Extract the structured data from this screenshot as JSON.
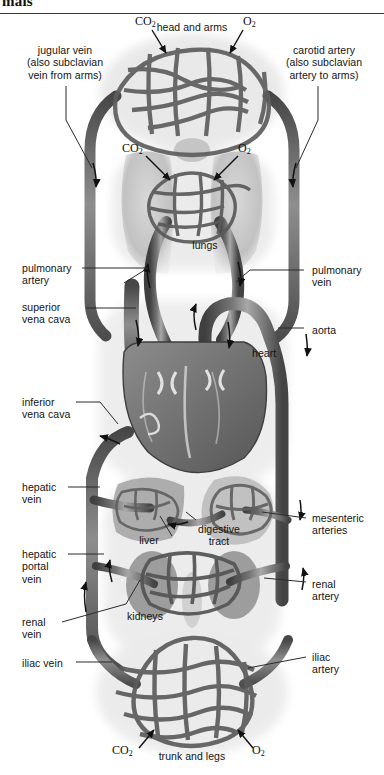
{
  "page": {
    "header_partial_word": "mals",
    "width": 384,
    "height": 775,
    "style": "grayscale anatomical illustration"
  },
  "figure": {
    "ink_color": "#3b3b3b",
    "vessel_dark": "#4a4a4a",
    "vessel_mid": "#6d6d6d",
    "vessel_light": "#9a9a9a",
    "organ_wash": "#bdbdbd",
    "background": "#ffffff"
  },
  "labels": {
    "left": [
      {
        "id": "jugular-vein",
        "text": "jugular vein\n(also subclavian\nvein from arms)",
        "x": 27,
        "y": 44,
        "align": "center"
      },
      {
        "id": "pulmonary-artery",
        "text": "pulmonary\nartery",
        "x": 22,
        "y": 262,
        "align": "left"
      },
      {
        "id": "superior-vena-cava",
        "text": "superior\nvena cava",
        "x": 22,
        "y": 301,
        "align": "left"
      },
      {
        "id": "inferior-vena-cava",
        "text": "inferior\nvena cava",
        "x": 22,
        "y": 396,
        "align": "left"
      },
      {
        "id": "hepatic-vein",
        "text": "hepatic\nvein",
        "x": 22,
        "y": 481,
        "align": "left"
      },
      {
        "id": "hepatic-portal-vein",
        "text": "hepatic\nportal\nvein",
        "x": 22,
        "y": 548,
        "align": "left"
      },
      {
        "id": "renal-vein",
        "text": "renal\nvein",
        "x": 22,
        "y": 616,
        "align": "left"
      },
      {
        "id": "iliac-vein",
        "text": "iliac vein",
        "x": 22,
        "y": 657,
        "align": "left"
      }
    ],
    "right": [
      {
        "id": "carotid-artery",
        "text": "carotid artery\n(also subclavian\nartery to arms)",
        "x": 287,
        "y": 44,
        "align": "center"
      },
      {
        "id": "pulmonary-vein",
        "text": "pulmonary\nvein",
        "x": 312,
        "y": 264,
        "align": "left"
      },
      {
        "id": "aorta",
        "text": "aorta",
        "x": 312,
        "y": 324,
        "align": "left"
      },
      {
        "id": "mesenteric-arteries",
        "text": "mesenteric\narteries",
        "x": 312,
        "y": 512,
        "align": "left"
      },
      {
        "id": "renal-artery",
        "text": "renal\nartery",
        "x": 312,
        "y": 578,
        "align": "left"
      },
      {
        "id": "iliac-artery",
        "text": "iliac\nartery",
        "x": 312,
        "y": 651,
        "align": "left"
      }
    ],
    "inner": [
      {
        "id": "head-and-arms",
        "text": "head and arms",
        "x": 192,
        "y": 26,
        "align": "center"
      },
      {
        "id": "lungs",
        "text": "lungs",
        "x": 205,
        "y": 243,
        "align": "center"
      },
      {
        "id": "heart",
        "text": "heart",
        "x": 258,
        "y": 350,
        "align": "left"
      },
      {
        "id": "liver",
        "text": "liver",
        "x": 148,
        "y": 538,
        "align": "center"
      },
      {
        "id": "digestive-tract",
        "text": "digestive\ntract",
        "x": 218,
        "y": 527,
        "align": "center"
      },
      {
        "id": "kidneys",
        "text": "kidneys",
        "x": 129,
        "y": 613,
        "align": "left"
      },
      {
        "id": "trunk-and-legs",
        "text": "trunk and legs",
        "x": 192,
        "y": 753,
        "align": "center"
      }
    ]
  },
  "gas_markers": [
    {
      "id": "co2-head",
      "formula": "CO",
      "subscript": "2",
      "x": 141,
      "y": 19,
      "site": "head and arms capillaries"
    },
    {
      "id": "o2-head",
      "formula": "O",
      "subscript": "2",
      "x": 244,
      "y": 19,
      "site": "head and arms capillaries"
    },
    {
      "id": "co2-lungs",
      "formula": "CO",
      "subscript": "2",
      "x": 128,
      "y": 146,
      "site": "lung capillaries"
    },
    {
      "id": "o2-lungs",
      "formula": "O",
      "subscript": "2",
      "x": 238,
      "y": 146,
      "site": "lung capillaries"
    },
    {
      "id": "co2-trunk",
      "formula": "CO",
      "subscript": "2",
      "x": 119,
      "y": 748,
      "site": "trunk and legs capillaries"
    },
    {
      "id": "o2-trunk",
      "formula": "O",
      "subscript": "2",
      "x": 252,
      "y": 748,
      "site": "trunk and legs capillaries"
    }
  ],
  "capillary_beds": [
    {
      "id": "head-arms-bed",
      "label": "head and arms",
      "cx": 192,
      "cy": 88,
      "rx": 80,
      "ry": 48
    },
    {
      "id": "lung-bed",
      "label": "lungs",
      "cx": 192,
      "cy": 205,
      "rx": 46,
      "ry": 32
    },
    {
      "id": "liver-bed",
      "label": "liver",
      "cx": 147,
      "cy": 505,
      "rx": 32,
      "ry": 21
    },
    {
      "id": "gut-bed",
      "label": "digestive tract",
      "cx": 245,
      "cy": 503,
      "rx": 33,
      "ry": 24
    },
    {
      "id": "kidney-bed",
      "label": "kidneys",
      "cx": 192,
      "cy": 583,
      "rx": 47,
      "ry": 31
    },
    {
      "id": "trunk-legs-bed",
      "label": "trunk and legs",
      "cx": 192,
      "cy": 690,
      "rx": 78,
      "ry": 52
    }
  ],
  "flow_arrows": [
    {
      "id": "arrow-jugular-down",
      "x": 96,
      "y": 175,
      "direction": "down"
    },
    {
      "id": "arrow-carotid-down",
      "x": 293,
      "y": 175,
      "direction": "down"
    },
    {
      "id": "arrow-pulm-artery-up",
      "x": 148,
      "y": 275,
      "direction": "up"
    },
    {
      "id": "arrow-pulm-vein-down",
      "x": 240,
      "y": 275,
      "direction": "down"
    },
    {
      "id": "arrow-svc-down",
      "x": 140,
      "y": 332,
      "direction": "down"
    },
    {
      "id": "arrow-aortic-arch-up",
      "x": 197,
      "y": 315,
      "direction": "up"
    },
    {
      "id": "arrow-aorta-down",
      "x": 228,
      "y": 335,
      "direction": "down"
    },
    {
      "id": "arrow-aorta-desc",
      "x": 305,
      "y": 345,
      "direction": "down"
    },
    {
      "id": "arrow-ivc-up",
      "x": 112,
      "y": 441,
      "direction": "up"
    },
    {
      "id": "arrow-portal-up",
      "x": 175,
      "y": 520,
      "direction": "left"
    },
    {
      "id": "arrow-renal-up",
      "x": 79,
      "y": 600,
      "direction": "up"
    },
    {
      "id": "arrow-hepatic-up",
      "x": 105,
      "y": 572,
      "direction": "up"
    }
  ]
}
